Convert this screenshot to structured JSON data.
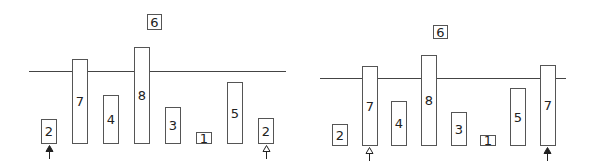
{
  "panels": [
    {
      "name": "left",
      "pivot": {
        "label": "6",
        "x": 147,
        "y": 14,
        "w": 15,
        "h": 16
      },
      "line": {
        "x": 29,
        "y": 71,
        "w": 257
      },
      "bars": [
        {
          "label": "2",
          "x": 41,
          "top": 119,
          "bottom": 144
        },
        {
          "label": "7",
          "x": 72,
          "top": 59,
          "bottom": 144
        },
        {
          "label": "4",
          "x": 103,
          "top": 95,
          "bottom": 144
        },
        {
          "label": "8",
          "x": 134,
          "top": 47,
          "bottom": 144
        },
        {
          "label": "3",
          "x": 165,
          "top": 107,
          "bottom": 144
        },
        {
          "label": "1",
          "x": 196,
          "top": 132,
          "bottom": 144
        },
        {
          "label": "5",
          "x": 227,
          "top": 82,
          "bottom": 144
        },
        {
          "label": "2",
          "x": 258,
          "top": 118,
          "bottom": 144
        }
      ],
      "arrows": [
        {
          "type": "filled",
          "x": 45,
          "y": 145
        },
        {
          "type": "hollow",
          "x": 262,
          "y": 145
        }
      ]
    },
    {
      "name": "right",
      "pivot": {
        "label": "6",
        "x": 433,
        "y": 25,
        "w": 15,
        "h": 14
      },
      "line": {
        "x": 320,
        "y": 78,
        "w": 246
      },
      "bars": [
        {
          "label": "2",
          "x": 332,
          "top": 124,
          "bottom": 146
        },
        {
          "label": "7",
          "x": 362,
          "top": 66,
          "bottom": 146
        },
        {
          "label": "4",
          "x": 391,
          "top": 101,
          "bottom": 146
        },
        {
          "label": "8",
          "x": 421,
          "top": 55,
          "bottom": 146
        },
        {
          "label": "3",
          "x": 451,
          "top": 112,
          "bottom": 146
        },
        {
          "label": "1",
          "x": 480,
          "top": 135,
          "bottom": 146
        },
        {
          "label": "5",
          "x": 510,
          "top": 88,
          "bottom": 146
        },
        {
          "label": "7",
          "x": 540,
          "top": 65,
          "bottom": 146
        }
      ],
      "arrows": [
        {
          "type": "hollow",
          "x": 365,
          "y": 147
        },
        {
          "type": "filled",
          "x": 543,
          "y": 147
        }
      ]
    }
  ],
  "bar_width": 16
}
